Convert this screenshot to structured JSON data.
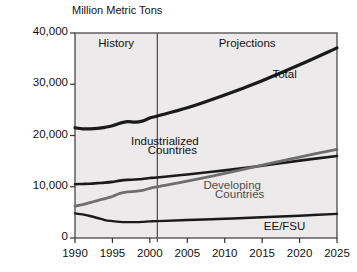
{
  "chart_data": {
    "type": "line",
    "title": "",
    "ylabel": "Million Metric Tons",
    "xlabel": "",
    "xlim": [
      1990,
      2025
    ],
    "ylim": [
      0,
      40000
    ],
    "grid": false,
    "legend_position": "inline-annotations",
    "yticks": [
      0,
      10000,
      20000,
      30000,
      40000
    ],
    "ytick_labels": [
      "0",
      "10,000",
      "20,000",
      "30,000",
      "40,000"
    ],
    "xticks": [
      1990,
      1995,
      2000,
      2005,
      2010,
      2015,
      2020,
      2025
    ],
    "xtick_labels": [
      "1990",
      "1995",
      "2000",
      "2005",
      "2010",
      "2015",
      "2020",
      "2025"
    ],
    "divider_x": 2001,
    "regions": [
      {
        "label": "History",
        "from": 1990,
        "to": 2001
      },
      {
        "label": "Projections",
        "from": 2001,
        "to": 2025
      }
    ],
    "x": [
      1990,
      1991,
      1992,
      1993,
      1994,
      1995,
      1996,
      1997,
      1998,
      1999,
      2000,
      2001,
      2005,
      2010,
      2015,
      2020,
      2025
    ],
    "series": [
      {
        "name": "Total",
        "color": "#1a1a1a",
        "width": 3.2,
        "values": [
          21500,
          21300,
          21300,
          21400,
          21600,
          21900,
          22400,
          22700,
          22600,
          22800,
          23400,
          23800,
          25400,
          27900,
          30700,
          33800,
          37100
        ]
      },
      {
        "name": "Industrialized Countries",
        "color": "#1a1a1a",
        "width": 2.6,
        "values": [
          10500,
          10550,
          10600,
          10700,
          10800,
          10950,
          11200,
          11350,
          11400,
          11500,
          11700,
          11800,
          12400,
          13200,
          14100,
          15100,
          16000
        ]
      },
      {
        "name": "Developing Countries",
        "color": "#6e6e6e",
        "width": 2.8,
        "values": [
          6200,
          6500,
          6900,
          7300,
          7700,
          8100,
          8700,
          9000,
          9100,
          9300,
          9700,
          10000,
          11100,
          12600,
          14200,
          15800,
          17300
        ]
      },
      {
        "name": "EE/FSU",
        "color": "#1a1a1a",
        "width": 2.4,
        "values": [
          4800,
          4600,
          4300,
          3900,
          3500,
          3300,
          3150,
          3100,
          3100,
          3150,
          3250,
          3300,
          3500,
          3750,
          4050,
          4350,
          4700
        ]
      }
    ],
    "annotations": [
      {
        "text": "Total",
        "x": 2018,
        "y": 31700,
        "style": "dark"
      },
      {
        "text": "Industrialized",
        "x": 2002,
        "y": 18600,
        "style": "dark"
      },
      {
        "text": "Countries",
        "x": 2003,
        "y": 16700,
        "style": "dark"
      },
      {
        "text": "Developing",
        "x": 2011,
        "y": 9900,
        "style": "gray"
      },
      {
        "text": "Countries",
        "x": 2012,
        "y": 8100,
        "style": "gray"
      },
      {
        "text": "EE/FSU",
        "x": 2018,
        "y": 1900,
        "style": "dark"
      }
    ]
  }
}
